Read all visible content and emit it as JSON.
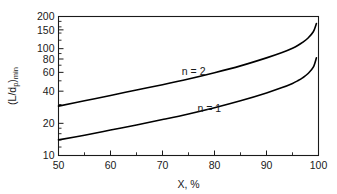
{
  "chart_data": {
    "type": "line",
    "title": "",
    "xlabel": "X, %",
    "ylabel": "(L/dp)min",
    "ylabel_parts": {
      "open": "(L/d",
      "sub1": "p",
      "close": ")",
      "sub2": "min"
    },
    "xlim": [
      50,
      100
    ],
    "ylim": [
      10,
      200
    ],
    "yscale": "log",
    "xscale": "linear",
    "grid": false,
    "legend_position": "inline-curve-labels",
    "xticks": [
      50,
      60,
      70,
      80,
      90,
      100
    ],
    "xticklabels": [
      "50",
      "60",
      "70",
      "80",
      "90",
      "100"
    ],
    "xminorticks": [
      55,
      65,
      75,
      85,
      95
    ],
    "yticks": [
      10,
      20,
      40,
      60,
      80,
      100,
      150,
      200
    ],
    "yticklabels": [
      "10",
      "20",
      "40",
      "60",
      "80",
      "100",
      "150",
      "200"
    ],
    "yminorticks": [
      12,
      14,
      16,
      18,
      30,
      50,
      70,
      90,
      120,
      140,
      160,
      180
    ],
    "series": [
      {
        "name": "n = 2",
        "label": "n = 2",
        "label_x": 76,
        "label_y": 57,
        "x": [
          50,
          55,
          60,
          65,
          70,
          75,
          80,
          85,
          90,
          93,
          95,
          96,
          97,
          98,
          99,
          99.6
        ],
        "values": [
          29,
          32.5,
          36.5,
          41,
          46,
          52,
          59.5,
          69,
          82,
          92,
          101,
          107,
          115,
          126,
          144,
          172
        ]
      },
      {
        "name": "n = 1",
        "label": "n = 1",
        "label_x": 79,
        "label_y": 25.5,
        "x": [
          50,
          55,
          60,
          65,
          70,
          75,
          80,
          85,
          90,
          93,
          95,
          96,
          97,
          98,
          99,
          99.6
        ],
        "values": [
          14,
          15.5,
          17.3,
          19.3,
          21.7,
          24.5,
          28,
          32.5,
          38.5,
          43.2,
          47.3,
          50,
          53.5,
          58.5,
          67,
          82
        ]
      }
    ]
  }
}
